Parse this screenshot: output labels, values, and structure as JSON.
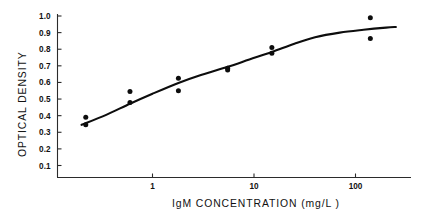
{
  "chart_data": {
    "type": "scatter",
    "title": "",
    "xlabel": "IgM CONCENTRATION (mg/L )",
    "ylabel": "OPTICAL DENSITY",
    "xscale": "log",
    "yscale": "linear",
    "xlim": [
      0.15,
      250
    ],
    "ylim": [
      0.0,
      1.05
    ],
    "grid": false,
    "legend": null,
    "xticks": [
      {
        "value": 1,
        "label": "1"
      },
      {
        "value": 10,
        "label": "10"
      },
      {
        "value": 100,
        "label": "100"
      }
    ],
    "yticks": [
      {
        "value": 1.0,
        "label": "1.0"
      },
      {
        "value": 0.9,
        "label": "0.9"
      },
      {
        "value": 0.8,
        "label": "0.8"
      },
      {
        "value": 0.7,
        "label": "0.7"
      },
      {
        "value": 0.6,
        "label": "0.6"
      },
      {
        "value": 0.5,
        "label": "0.5"
      },
      {
        "value": 0.4,
        "label": "0.4"
      },
      {
        "value": 0.3,
        "label": "0.3"
      },
      {
        "value": 0.2,
        "label": "0.2"
      },
      {
        "value": 0.1,
        "label": "0.1"
      }
    ],
    "series": [
      {
        "name": "Optical density measurements",
        "marker": "filled-circle",
        "color": "#0d0d0d",
        "points": [
          {
            "x": 0.22,
            "y": 0.39
          },
          {
            "x": 0.22,
            "y": 0.345
          },
          {
            "x": 0.6,
            "y": 0.545
          },
          {
            "x": 0.6,
            "y": 0.48
          },
          {
            "x": 1.8,
            "y": 0.625
          },
          {
            "x": 1.8,
            "y": 0.55
          },
          {
            "x": 5.5,
            "y": 0.685
          },
          {
            "x": 5.5,
            "y": 0.675
          },
          {
            "x": 15,
            "y": 0.81
          },
          {
            "x": 15,
            "y": 0.775
          },
          {
            "x": 140,
            "y": 0.99
          },
          {
            "x": 140,
            "y": 0.865
          }
        ]
      }
    ],
    "fit_curve": {
      "name": "sigmoid calibration fit",
      "color": "#0d0d0d",
      "points": [
        {
          "x": 0.2,
          "y": 0.345
        },
        {
          "x": 0.35,
          "y": 0.405
        },
        {
          "x": 0.6,
          "y": 0.472
        },
        {
          "x": 1.0,
          "y": 0.532
        },
        {
          "x": 1.8,
          "y": 0.597
        },
        {
          "x": 3.0,
          "y": 0.645
        },
        {
          "x": 5.5,
          "y": 0.694
        },
        {
          "x": 9.0,
          "y": 0.738
        },
        {
          "x": 15,
          "y": 0.783
        },
        {
          "x": 25,
          "y": 0.833
        },
        {
          "x": 40,
          "y": 0.872
        },
        {
          "x": 70,
          "y": 0.9
        },
        {
          "x": 120,
          "y": 0.917
        },
        {
          "x": 200,
          "y": 0.93
        },
        {
          "x": 250,
          "y": 0.934
        }
      ]
    }
  }
}
